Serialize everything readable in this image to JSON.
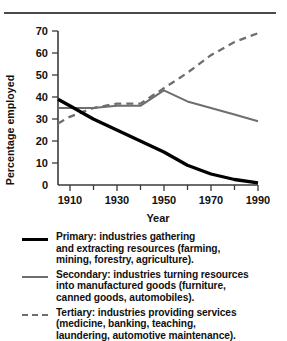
{
  "page": {
    "cropped_caption_above_rule": "",
    "divider": "horizontal-rule"
  },
  "chart_data": {
    "type": "line",
    "title": "",
    "xlabel": "Year",
    "ylabel": "Percentage employed",
    "xlim": [
      1905,
      1990
    ],
    "ylim": [
      0,
      70
    ],
    "yticks": [
      0,
      10,
      20,
      30,
      40,
      50,
      60,
      70
    ],
    "ytick_labels": [
      "0",
      "10",
      "20",
      "30",
      "40",
      "50",
      "60",
      "70"
    ],
    "xticks": [
      1910,
      1920,
      1930,
      1940,
      1950,
      1960,
      1970,
      1980,
      1990
    ],
    "xtick_labels": [
      "1910",
      "",
      "1930",
      "",
      "1950",
      "",
      "1970",
      "",
      "1990"
    ],
    "grid": false,
    "legend_position": "below",
    "series": [
      {
        "name": "Primary",
        "style": "solid-thick",
        "color": "#000000",
        "x": [
          1905,
          1910,
          1920,
          1930,
          1940,
          1950,
          1960,
          1970,
          1980,
          1990
        ],
        "values": [
          39,
          36,
          30,
          25,
          20,
          15,
          9,
          5,
          2.5,
          1
        ]
      },
      {
        "name": "Secondary",
        "style": "solid",
        "color": "#6e6e6e",
        "x": [
          1905,
          1910,
          1920,
          1930,
          1940,
          1950,
          1960,
          1970,
          1980,
          1990
        ],
        "values": [
          35,
          35,
          35,
          36,
          36,
          43,
          38,
          35,
          32,
          29
        ]
      },
      {
        "name": "Tertiary",
        "style": "dashed",
        "color": "#6e6e6e",
        "x": [
          1905,
          1910,
          1920,
          1930,
          1940,
          1950,
          1960,
          1970,
          1980,
          1990
        ],
        "values": [
          28,
          31,
          35,
          37,
          37,
          44,
          51,
          59,
          65,
          69
        ]
      }
    ]
  },
  "axis": {
    "ytick_0": "0",
    "ytick_10": "10",
    "ytick_20": "20",
    "ytick_30": "30",
    "ytick_40": "40",
    "ytick_50": "50",
    "ytick_60": "60",
    "ytick_70": "70",
    "xtick_1910": "1910",
    "xtick_1930": "1930",
    "xtick_1950": "1950",
    "xtick_1970": "1970",
    "xtick_1990": "1990",
    "xlabel": "Year",
    "ylabel": "Percentage employed"
  },
  "legend": {
    "items": [
      {
        "key": "primary-line-key",
        "style": "solid-primary",
        "lines": [
          "Primary: industries gathering",
          "and extracting resources (farming,",
          "mining, forestry, agriculture)."
        ]
      },
      {
        "key": "secondary-line-key",
        "style": "solid-secondary",
        "lines": [
          "Secondary: industries turning resources",
          "into manufactured goods (furniture,",
          "canned goods, automobiles)."
        ]
      },
      {
        "key": "tertiary-line-key",
        "style": "dashed-tertiary",
        "lines": [
          "Tertiary: industries providing services",
          "(medicine, banking, teaching,",
          "laundering, automotive maintenance)."
        ]
      }
    ]
  }
}
